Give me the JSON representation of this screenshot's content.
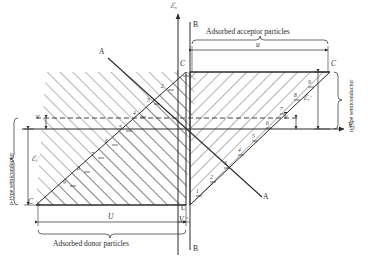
{
  "figure": {
    "type": "band-diagram",
    "axes": {
      "vertical_label": "ℰ",
      "vertical_sub": "v",
      "horizontal_label": "V",
      "horizontal_sub": "S"
    },
    "section_line": {
      "top": "B",
      "bottom": "B"
    },
    "diagonal_line": {
      "top": "A",
      "bottom": "A"
    },
    "corner_markers": {
      "top_left": "C",
      "top_right": "C",
      "bottom_left": "C",
      "bottom_right": "C"
    },
    "captions": {
      "acceptor": "Adsorbed acceptor particles",
      "donor": "Adsorbed donor particles",
      "left_region": "p-type semiconductor",
      "right_region": "n-type semiconductor"
    },
    "dimensions": {
      "top_span": "u",
      "bottom_span": "U",
      "left_gap": "v",
      "right_gap": "v̄",
      "left_height_symbol": "ℰ",
      "left_height_sub": "i",
      "left_height_sup": "+",
      "right_height_symbol": "ℰ",
      "right_height_sub": "i",
      "right_height_sup": "−",
      "bottom_axis_symbol": "V",
      "bottom_axis_sub": "S",
      "bottom_axis_sup": "*"
    },
    "tick_numbers_left": [
      "1",
      "2",
      "3",
      "4",
      "5",
      "6",
      "7",
      "8",
      "9"
    ],
    "tick_numbers_right": [
      "1",
      "2",
      "3",
      "4",
      "5",
      "6",
      "7",
      "8",
      "9"
    ],
    "colors": {
      "ink": "#2b2b2b",
      "hatch": "#4a4a4a",
      "background": "#ffffff"
    }
  }
}
